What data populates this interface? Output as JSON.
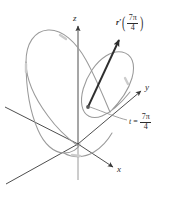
{
  "figure": {
    "kind": "3d-space-curve-with-tangent-vector",
    "width": 176,
    "height": 200,
    "background_color": "#ffffff"
  },
  "axes": {
    "z_label": "z",
    "y_label": "y",
    "x_label": "x",
    "axis_color": "#3a3a3a",
    "origin": {
      "x": 78,
      "y": 144
    }
  },
  "curve": {
    "name": "space-curve",
    "color": "#9a9a9a",
    "highlight_color": "#c9c9c9"
  },
  "tangent_vector": {
    "color": "#2e2e2e",
    "tail": {
      "x": 88,
      "y": 106
    },
    "tip": {
      "x": 120,
      "y": 38
    }
  },
  "labels": {
    "vector_label": {
      "symbol": "r",
      "prime": "′",
      "open_paren": "(",
      "close_paren": ")",
      "numerator": "7π",
      "denominator": "4"
    },
    "parameter_label": {
      "variable": "t",
      "equals": "=",
      "numerator": "7π",
      "denominator": "4"
    }
  }
}
